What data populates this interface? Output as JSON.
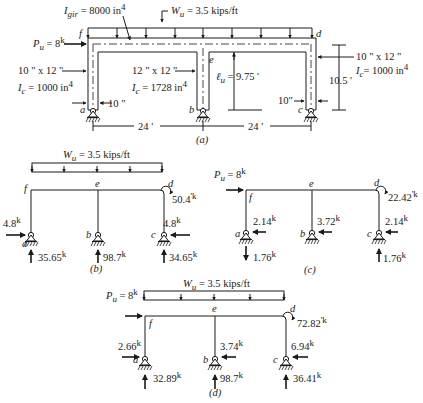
{
  "figure_a": {
    "caption": "(a)",
    "I_gir": "I",
    "I_gir_sub": "gir",
    "I_gir_value": " = 8000 in",
    "I_gir_exp": "4",
    "Wu_label": "W",
    "Wu_sub": "u",
    "Wu_value": " =  3.5 kips/ft",
    "Pu_label": "P",
    "Pu_sub": "u",
    "Pu_value": " = 8",
    "Pu_unit": "k",
    "left_col_size": "10 \" x 12 \"",
    "left_col_I": "I",
    "left_col_I_sub": "c",
    "left_col_I_value": " = 1000 in",
    "left_col_I_exp": "4",
    "left_col_width": "10 \"",
    "mid_col_size": "12 \" x 12 \"",
    "mid_col_I": "I",
    "mid_col_I_sub": "c",
    "mid_col_I_value": "  = 1728 in",
    "mid_col_I_exp": "4",
    "lu_label": "ℓ",
    "lu_sub": "u",
    "lu_value": " = 9.75 '",
    "right_col_size": "10 \" x 12 \"",
    "right_col_I": "I",
    "right_col_I_sub": "c",
    "right_col_I_value": "= 1000 in",
    "right_col_I_exp": "4",
    "right_col_width": "10\"",
    "height_dim": "10.5 '",
    "span_left": "24 '",
    "span_right": "24 '",
    "nodes": {
      "a": "a",
      "b": "b",
      "c": "c",
      "d": "d",
      "e": "e",
      "f": "f"
    }
  },
  "figure_b": {
    "caption": "(b)",
    "Wu_label": "W",
    "Wu_sub": "u",
    "Wu_value": " = 3.5 kips/ft",
    "moment_d": "50.4",
    "moment_unit": "'k",
    "H_a": "4.8",
    "H_c": "4.8",
    "V_a": "35.65",
    "V_b": "98.7",
    "V_c": "34.65",
    "unit": "k",
    "nodes": {
      "a": "a",
      "b": "b",
      "c": "c",
      "d": "d",
      "e": "e",
      "f": "f"
    }
  },
  "figure_c": {
    "caption": "(c)",
    "Pu_label": "P",
    "Pu_sub": "u",
    "Pu_value": " = 8",
    "moment_d": "22.42",
    "moment_unit": "'k",
    "H_a": "2.14",
    "H_b": "3.72",
    "H_c": "2.14",
    "V_a": "1.76",
    "V_c": "1.76",
    "unit": "k",
    "nodes": {
      "a": "a",
      "b": "b",
      "c": "c",
      "d": "d",
      "e": "e",
      "f": "f"
    }
  },
  "figure_d": {
    "caption": "(d)",
    "Wu_label": "W",
    "Wu_sub": "u",
    "Wu_value": " = 3.5 kips/ft",
    "Pu_label": "P",
    "Pu_sub": "u",
    "Pu_value": " = 8",
    "moment_d": "72.82",
    "moment_unit": "'k",
    "H_a": "2.66",
    "H_b": "3.74",
    "H_c": "6.94",
    "V_a": "32.89",
    "V_b": "98.7",
    "V_c": "36.41",
    "unit": "k",
    "nodes": {
      "a": "a",
      "b": "b",
      "c": "c",
      "d": "d",
      "e": "e",
      "f": "f"
    }
  }
}
